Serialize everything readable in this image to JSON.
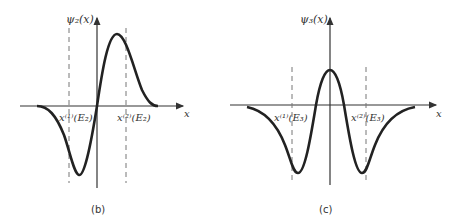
{
  "figure": {
    "panels": [
      {
        "id": "b",
        "caption": "(b)",
        "y_axis_label": "ψ₂(x)",
        "x_axis_label": "x",
        "turning_point_1": "x⁽¹⁾(E₂)",
        "turning_point_2": "x⁽²⁾(E₂)",
        "description": "Second-state wavefunction: one node at origin, negative lobe left, positive lobe right"
      },
      {
        "id": "c",
        "caption": "(c)",
        "y_axis_label": "ψ₃(x)",
        "x_axis_label": "x",
        "turning_point_1": "x⁽¹⁾(E₃)",
        "turning_point_2": "x⁽²⁾(E₃)",
        "description": "Third-state wavefunction: two nodes, positive central peak, two negative lobes"
      }
    ],
    "colors": {
      "curve": "#222222",
      "axis": "#333333",
      "dashed": "#777777"
    }
  }
}
